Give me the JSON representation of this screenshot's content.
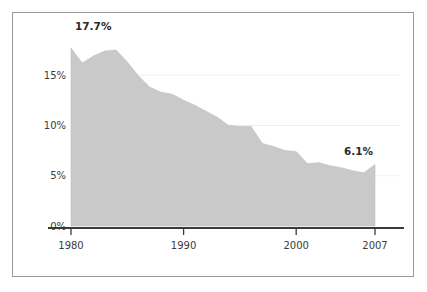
{
  "chart_data": {
    "type": "area",
    "title": "",
    "subtitle": "",
    "xlabel": "",
    "ylabel": "",
    "xlim": [
      1980,
      2007
    ],
    "ylim": [
      0,
      19
    ],
    "grid": true,
    "legend": null,
    "value_suffix": "%",
    "x": [
      1980,
      1981,
      1982,
      1983,
      1984,
      1985,
      1986,
      1987,
      1988,
      1989,
      1990,
      1991,
      1992,
      1993,
      1994,
      1995,
      1996,
      1997,
      1998,
      1999,
      2000,
      2001,
      2002,
      2003,
      2004,
      2005,
      2006,
      2007
    ],
    "values": [
      17.7,
      16.2,
      16.9,
      17.4,
      17.5,
      16.3,
      14.9,
      13.8,
      13.3,
      13.1,
      12.5,
      12.0,
      11.4,
      10.8,
      10.0,
      9.9,
      9.9,
      8.2,
      7.9,
      7.5,
      7.4,
      6.2,
      6.3,
      6.0,
      5.8,
      5.5,
      5.3,
      6.1
    ],
    "xticks": [
      1980,
      1990,
      2000,
      2007
    ],
    "xticklabels": [
      "1980",
      "1990",
      "2000",
      "2007"
    ],
    "yticks": [
      0,
      5,
      10,
      15
    ],
    "yticklabels": [
      "0%",
      "5%",
      "10%",
      "15%"
    ],
    "annotations": [
      {
        "label": "17.7%",
        "x": 1980,
        "y": 17.7,
        "position": "above-right"
      },
      {
        "label": "6.1%",
        "x": 2007,
        "y": 6.1,
        "position": "above-left"
      }
    ],
    "colors": {
      "area_fill": "#c9c9c9",
      "area_edge": "#c0c0c0",
      "axis_line": "#3a3a3a",
      "grid_line": "#ededed",
      "frame_border": "#9a9a9a",
      "text": "#3b3b3b",
      "background": "#ffffff"
    }
  }
}
